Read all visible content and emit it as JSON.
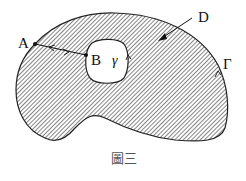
{
  "figure": {
    "caption": "圖三",
    "labels": {
      "A": "A",
      "B": "B",
      "D": "D",
      "gamma": "γ",
      "Gamma": "Γ"
    }
  },
  "colors": {
    "stroke": "#222222",
    "hatch": "#444444",
    "background": "#ffffff"
  }
}
